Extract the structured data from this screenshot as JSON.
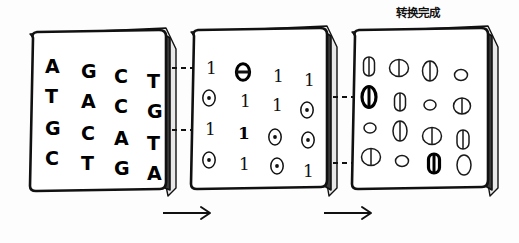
{
  "diagram": {
    "title_caption": "转换完成",
    "background_color": "#fdfdfd",
    "ink_color": "#111111",
    "panels": [
      {
        "id": "panel-dna",
        "name": "dna-sequence-panel",
        "kind": "letters",
        "rows": [
          [
            "A",
            "G",
            "C",
            "T"
          ],
          [
            "T",
            "A",
            "C",
            "G"
          ],
          [
            "G",
            "C",
            "A",
            "T"
          ],
          [
            "C",
            "T",
            "G",
            "A"
          ]
        ]
      },
      {
        "id": "panel-binary",
        "name": "binary-matrix-panel",
        "kind": "bits",
        "rows": [
          [
            "1",
            "0",
            "1",
            "1"
          ],
          [
            "0",
            "1",
            "1",
            "0"
          ],
          [
            "1",
            "1",
            "0",
            "0"
          ],
          [
            "0",
            "1",
            "0",
            "1"
          ]
        ],
        "highlighted": [
          {
            "row": 0,
            "col": 1
          },
          {
            "row": 2,
            "col": 1
          }
        ]
      },
      {
        "id": "panel-cells",
        "name": "cell-shapes-panel",
        "kind": "cells",
        "rows": [
          [
            {
              "shape": "capsule",
              "w": 11,
              "h": 19,
              "divided": true
            },
            {
              "shape": "ellipse",
              "w": 19,
              "h": 17,
              "divided": true
            },
            {
              "shape": "ellipse",
              "w": 15,
              "h": 20,
              "divided": true
            },
            {
              "shape": "ellipse",
              "w": 13,
              "h": 11,
              "divided": false
            }
          ],
          [
            {
              "shape": "ellipse",
              "w": 14,
              "h": 21,
              "divided": true,
              "bold": true
            },
            {
              "shape": "capsule",
              "w": 11,
              "h": 18,
              "divided": true
            },
            {
              "shape": "ellipse",
              "w": 12,
              "h": 10,
              "divided": false
            },
            {
              "shape": "ellipse",
              "w": 17,
              "h": 16,
              "divided": true
            }
          ],
          [
            {
              "shape": "ellipse",
              "w": 12,
              "h": 10,
              "divided": false
            },
            {
              "shape": "ellipse",
              "w": 14,
              "h": 20,
              "divided": true
            },
            {
              "shape": "ellipse",
              "w": 19,
              "h": 17,
              "divided": true
            },
            {
              "shape": "capsule",
              "w": 12,
              "h": 19,
              "divided": true
            }
          ],
          [
            {
              "shape": "ellipse",
              "w": 19,
              "h": 17,
              "divided": true
            },
            {
              "shape": "ellipse",
              "w": 13,
              "h": 11,
              "divided": false
            },
            {
              "shape": "capsule",
              "w": 11,
              "h": 19,
              "divided": true,
              "bold": true
            },
            {
              "shape": "ellipse",
              "w": 14,
              "h": 20,
              "divided": false
            }
          ]
        ]
      }
    ],
    "arrows": [
      {
        "name": "arrow-dna-to-binary",
        "label": ""
      },
      {
        "name": "arrow-binary-to-cells",
        "label": ""
      }
    ],
    "connectors": [
      {
        "name": "connector-row1",
        "from": "panel-dna",
        "to": "panel-binary"
      },
      {
        "name": "connector-row3",
        "from": "panel-dna",
        "to": "panel-binary"
      },
      {
        "name": "connector-row2",
        "from": "panel-binary",
        "to": "panel-cells"
      },
      {
        "name": "connector-row4",
        "from": "panel-binary",
        "to": "panel-cells"
      }
    ]
  }
}
